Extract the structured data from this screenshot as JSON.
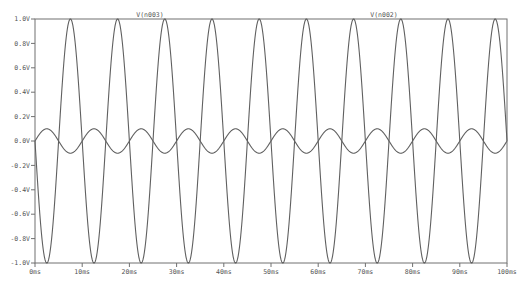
{
  "chart_data": {
    "type": "line",
    "title": "",
    "xlabel": "",
    "ylabel": "",
    "xlim": [
      0,
      100
    ],
    "ylim": [
      -1.0,
      1.0
    ],
    "x_unit": "ms",
    "y_unit": "V",
    "grid": false,
    "x_ticks": [
      "0ms",
      "10ms",
      "20ms",
      "30ms",
      "40ms",
      "50ms",
      "60ms",
      "70ms",
      "80ms",
      "90ms",
      "100ms"
    ],
    "y_ticks": [
      "1.0V",
      "0.8V",
      "0.6V",
      "0.4V",
      "0.2V",
      "0.0V",
      "-0.2V",
      "-0.4V",
      "-0.6V",
      "-0.8V",
      "-1.0V"
    ],
    "legend": [
      "V(n003)",
      "V(n002)"
    ],
    "series": [
      {
        "name": "V(n003)",
        "function": "-1.0*sin(2*pi*100*t)",
        "amplitude": 1.0,
        "frequency_hz": 100,
        "phase": "inverted",
        "color": "#606060"
      },
      {
        "name": "V(n002)",
        "function": "0.1*sin(2*pi*100*t)",
        "amplitude": 0.1,
        "frequency_hz": 100,
        "phase": "normal",
        "color": "#606060"
      }
    ]
  },
  "layout": {
    "plot_left": 35,
    "plot_right": 507,
    "plot_top": 19,
    "plot_bottom": 263,
    "axis_color": "#707070",
    "trace_color": "#606060",
    "legend_x": [
      150,
      384
    ]
  }
}
